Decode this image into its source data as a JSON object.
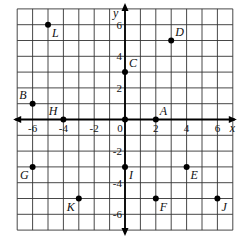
{
  "chart_data": {
    "type": "scatter",
    "title": "",
    "xlabel": "x",
    "ylabel": "y",
    "xlim": [
      -7,
      7
    ],
    "ylim": [
      -7,
      7
    ],
    "grid": true,
    "x_ticks": [
      {
        "value": -6,
        "label": "-6"
      },
      {
        "value": -4,
        "label": "-4"
      },
      {
        "value": -2,
        "label": "-2"
      },
      {
        "value": 0,
        "label": "0"
      },
      {
        "value": 2,
        "label": "2"
      },
      {
        "value": 4,
        "label": "4"
      },
      {
        "value": 6,
        "label": "6"
      }
    ],
    "y_ticks": [
      {
        "value": 6,
        "label": "6"
      },
      {
        "value": 4,
        "label": "4"
      },
      {
        "value": 2,
        "label": "2"
      },
      {
        "value": -2,
        "label": "-2"
      },
      {
        "value": -4,
        "label": "-4"
      },
      {
        "value": -6,
        "label": "-6"
      }
    ],
    "points": [
      {
        "label": "L",
        "x": -5,
        "y": 6,
        "label_pos": "below-right"
      },
      {
        "label": "D",
        "x": 3,
        "y": 5,
        "label_pos": "above-right"
      },
      {
        "label": "C",
        "x": 0,
        "y": 3,
        "label_pos": "above-right"
      },
      {
        "label": "B",
        "x": -6,
        "y": 1,
        "label_pos": "above-left"
      },
      {
        "label": "H",
        "x": -4,
        "y": 0,
        "label_pos": "above-left"
      },
      {
        "label": "A",
        "x": 2,
        "y": 0,
        "label_pos": "above-right"
      },
      {
        "label": "",
        "x": 0,
        "y": 0,
        "label_pos": "none"
      },
      {
        "label": "G",
        "x": -6,
        "y": -3,
        "label_pos": "below-left"
      },
      {
        "label": "I",
        "x": 0,
        "y": -3,
        "label_pos": "below-right"
      },
      {
        "label": "E",
        "x": 4,
        "y": -3,
        "label_pos": "below-right"
      },
      {
        "label": "K",
        "x": -3,
        "y": -5,
        "label_pos": "below-left"
      },
      {
        "label": "F",
        "x": 2,
        "y": -5,
        "label_pos": "below-right"
      },
      {
        "label": "J",
        "x": 6,
        "y": -5,
        "label_pos": "below-right"
      }
    ]
  }
}
